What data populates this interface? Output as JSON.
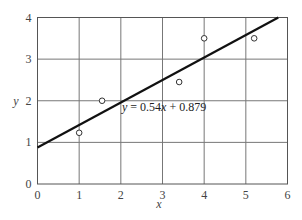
{
  "chart_data": {
    "type": "scatter",
    "title": "",
    "xlabel": "x",
    "ylabel": "y",
    "xlim": [
      0,
      6
    ],
    "ylim": [
      0,
      4
    ],
    "xticks": [
      "0",
      "1",
      "2",
      "3",
      "4",
      "5",
      "6"
    ],
    "yticks": [
      "0",
      "1",
      "2",
      "3",
      "4"
    ],
    "grid": true,
    "series": [
      {
        "name": "data points",
        "marker": "open-circle",
        "x": [
          1.0,
          1.55,
          3.4,
          4.0,
          5.2
        ],
        "y": [
          1.23,
          2.0,
          2.45,
          3.5,
          3.5
        ]
      },
      {
        "name": "fit line",
        "type": "line",
        "slope": 0.54,
        "intercept": 0.879,
        "x": [
          0,
          6
        ],
        "y": [
          0.879,
          4.119
        ]
      }
    ],
    "annotations": [
      {
        "text": "y = 0.54x + 0.879",
        "x": 2.0,
        "y": 1.85
      }
    ]
  },
  "labels": {
    "x": "x",
    "y": "y",
    "equation_prefix": "y",
    "equation_eq": " = 0.54",
    "equation_x": "x",
    "equation_rest": " + 0.879"
  }
}
